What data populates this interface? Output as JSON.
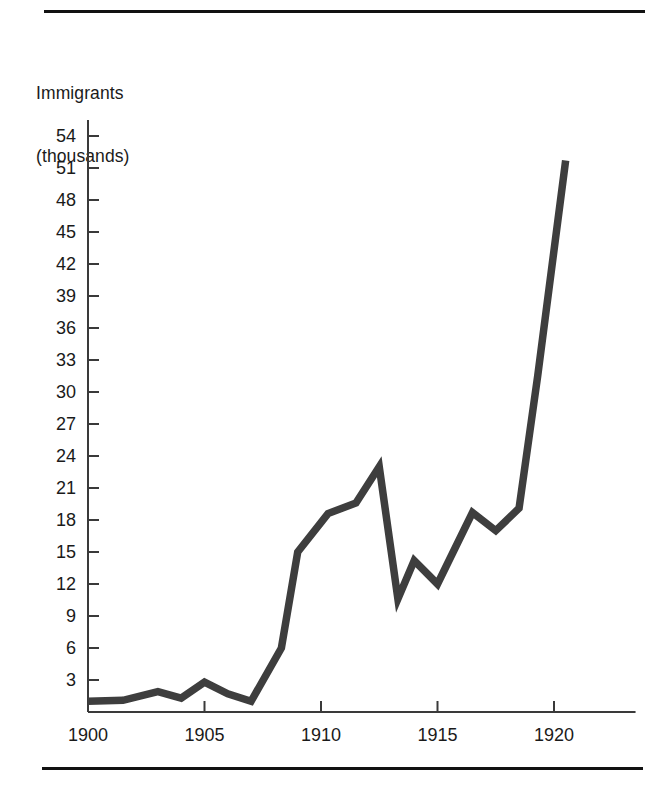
{
  "figure": {
    "axis_title_lines": [
      "Immigrants",
      "(thousands)"
    ],
    "rules": {
      "top_label": "top-rule",
      "bottom_label": "bottom-rule"
    }
  },
  "chart_data": {
    "type": "line",
    "title": "",
    "subtitle": "",
    "xlabel": "",
    "ylabel": "Immigrants (thousands)",
    "ylabel_lines": [
      "Immigrants",
      "(thousands)"
    ],
    "xlim": [
      1900,
      1923.5
    ],
    "ylim": [
      0,
      55.5
    ],
    "grid": false,
    "legend": null,
    "legend_position": "none",
    "line_color": "#3e3e3e",
    "axis_color": "#3a3a3a",
    "background_color": "#ffffff",
    "xticks": [
      1900,
      1905,
      1910,
      1915,
      1920
    ],
    "xticklabels": [
      "1900",
      "1905",
      "1910",
      "1915",
      "1920"
    ],
    "yticks": [
      3,
      6,
      9,
      12,
      15,
      18,
      21,
      24,
      27,
      30,
      33,
      36,
      39,
      42,
      45,
      48,
      51,
      54
    ],
    "yticklabels": [
      "3",
      "6",
      "9",
      "12",
      "15",
      "18",
      "21",
      "24",
      "27",
      "30",
      "33",
      "36",
      "39",
      "42",
      "45",
      "48",
      "51",
      "54"
    ],
    "x": [
      1900.0,
      1901.5,
      1903.0,
      1904.0,
      1905.0,
      1906.0,
      1907.0,
      1908.3,
      1909.0,
      1910.3,
      1911.5,
      1912.5,
      1913.3,
      1914.0,
      1915.0,
      1916.5,
      1917.5,
      1918.5,
      1919.3,
      1920.5
    ],
    "values": [
      1.0,
      1.1,
      1.9,
      1.3,
      2.8,
      1.7,
      1.0,
      6.0,
      15.0,
      18.6,
      19.6,
      23.0,
      10.6,
      14.2,
      12.0,
      18.7,
      17.0,
      19.1,
      31.5,
      51.7
    ],
    "series": [
      {
        "name": "Immigrants",
        "x": [
          1900.0,
          1901.5,
          1903.0,
          1904.0,
          1905.0,
          1906.0,
          1907.0,
          1908.3,
          1909.0,
          1910.3,
          1911.5,
          1912.5,
          1913.3,
          1914.0,
          1915.0,
          1916.5,
          1917.5,
          1918.5,
          1919.3,
          1920.5
        ],
        "values": [
          1.0,
          1.1,
          1.9,
          1.3,
          2.8,
          1.7,
          1.0,
          6.0,
          15.0,
          18.6,
          19.6,
          23.0,
          10.6,
          14.2,
          12.0,
          18.7,
          17.0,
          19.1,
          31.5,
          51.7
        ]
      }
    ],
    "annotations": []
  }
}
